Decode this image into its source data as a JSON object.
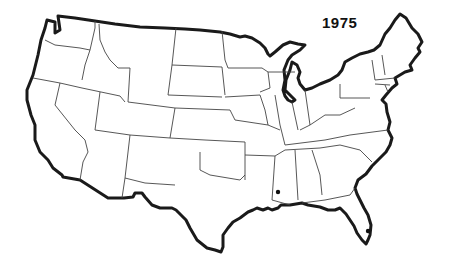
{
  "map": {
    "title": "1975",
    "region": "Contiguous United States",
    "style": "black and white outline map with state boundaries",
    "markers": [
      {
        "label": "marker-mississippi",
        "approx_location": "southern Mississippi",
        "x": 278,
        "y": 192
      },
      {
        "label": "marker-florida",
        "approx_location": "southeastern Florida coast",
        "x": 368,
        "y": 231
      }
    ],
    "colors": {
      "outline": "#1a1a1a",
      "state_lines": "#444444",
      "background": "#ffffff",
      "marker": "#111111"
    }
  }
}
